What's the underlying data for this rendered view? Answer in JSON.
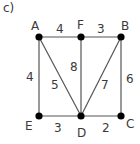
{
  "part_label": "c)",
  "nodes": [
    {
      "id": "A",
      "x": 39,
      "y": 37,
      "lx": 31,
      "ly": 30
    },
    {
      "id": "F",
      "x": 81,
      "y": 37,
      "lx": 77,
      "ly": 29
    },
    {
      "id": "B",
      "x": 121,
      "y": 37,
      "lx": 121,
      "ly": 30
    },
    {
      "id": "E",
      "x": 39,
      "y": 116,
      "lx": 25,
      "ly": 130
    },
    {
      "id": "D",
      "x": 81,
      "y": 116,
      "lx": 77,
      "ly": 137
    },
    {
      "id": "C",
      "x": 121,
      "y": 116,
      "lx": 126,
      "ly": 128
    }
  ],
  "edges": [
    {
      "from": "A",
      "to": "F",
      "weight": "4",
      "wx": 56,
      "wy": 33
    },
    {
      "from": "F",
      "to": "B",
      "weight": "3",
      "wx": 97,
      "wy": 33
    },
    {
      "from": "A",
      "to": "E",
      "weight": "4",
      "wx": 26,
      "wy": 81
    },
    {
      "from": "A",
      "to": "D",
      "weight": "5",
      "wx": 51,
      "wy": 89
    },
    {
      "from": "F",
      "to": "D",
      "weight": "8",
      "wx": 70,
      "wy": 71
    },
    {
      "from": "B",
      "to": "D",
      "weight": "7",
      "wx": 101,
      "wy": 89
    },
    {
      "from": "B",
      "to": "C",
      "weight": "6",
      "wx": 126,
      "wy": 83
    },
    {
      "from": "E",
      "to": "D",
      "weight": "3",
      "wx": 54,
      "wy": 132
    },
    {
      "from": "D",
      "to": "C",
      "weight": "2",
      "wx": 102,
      "wy": 132
    }
  ]
}
